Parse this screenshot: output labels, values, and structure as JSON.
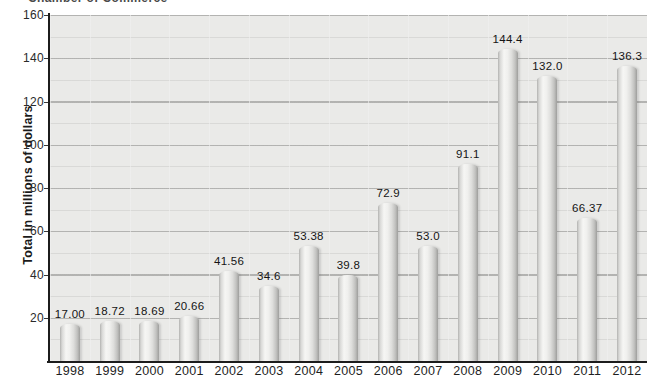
{
  "page": {
    "clipped_header_text": "Chamber of Commerce"
  },
  "chart_data": {
    "type": "bar",
    "categories": [
      "1998",
      "1999",
      "2000",
      "2001",
      "2002",
      "2003",
      "2004",
      "2005",
      "2006",
      "2007",
      "2008",
      "2009",
      "2010",
      "2011",
      "2012"
    ],
    "values": [
      17.0,
      18.72,
      18.69,
      20.66,
      41.56,
      34.6,
      53.38,
      39.8,
      72.9,
      53.0,
      91.1,
      144.4,
      132.0,
      66.37,
      136.3
    ],
    "value_labels": [
      "17.00",
      "18.72",
      "18.69",
      "20.66",
      "41.56",
      "34.6",
      "53.38",
      "39.8",
      "72.9",
      "53.0",
      "91.1",
      "144.4",
      "132.0",
      "66.37",
      "136.3"
    ],
    "xlabel": "",
    "ylabel": "Total in millions of dollars",
    "ylim": [
      0,
      160
    ],
    "ytick_interval": 20,
    "yticks": [
      160,
      140,
      120,
      100,
      80,
      60,
      40,
      20
    ],
    "grid": "horizontal major every 20, minor every 10, faint vertical per category; grid on",
    "legend_position": "none",
    "colors": {
      "plot_background": "#eaeae8",
      "grid_major": "#a9a9a7",
      "grid_minor": "#d2d2d0",
      "bar_fill_highlight": "#f6f6f4",
      "bar_fill_edge": "#9e9e9c",
      "axis_line": "#1c1c1c",
      "label_text": "#141414"
    }
  }
}
